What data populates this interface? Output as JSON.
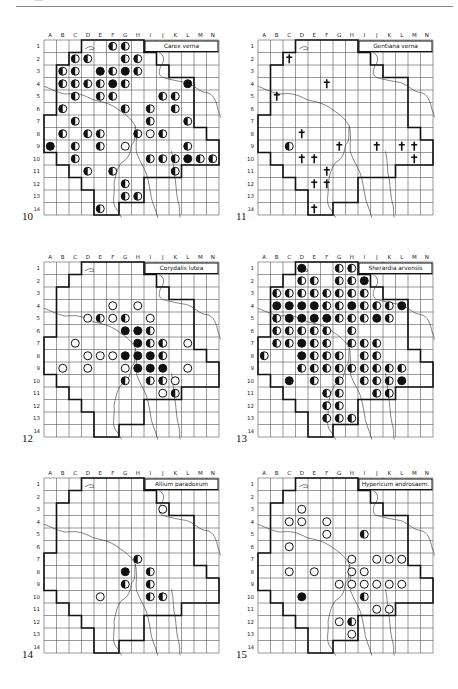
{
  "page": {
    "page_number": "118"
  },
  "grid": {
    "columns": [
      "A",
      "B",
      "C",
      "D",
      "E",
      "F",
      "G",
      "H",
      "I",
      "J",
      "K",
      "L",
      "M",
      "N"
    ],
    "rows": [
      "1",
      "2",
      "3",
      "4",
      "5",
      "6",
      "7",
      "8",
      "9",
      "10",
      "11",
      "12",
      "13",
      "14"
    ]
  },
  "legend_symbols": {
    "open": "open circle",
    "half": "half-filled circle",
    "full": "filled circle",
    "cross": "dagger (extinct)"
  },
  "maps": [
    {
      "figure": "10",
      "species": "Carex verna",
      "records": [
        [
          "F1",
          "half"
        ],
        [
          "G1",
          "half"
        ],
        [
          "C2",
          "half"
        ],
        [
          "D2",
          "half"
        ],
        [
          "G2",
          "half"
        ],
        [
          "H2",
          "half"
        ],
        [
          "B3",
          "half"
        ],
        [
          "C3",
          "half"
        ],
        [
          "E3",
          "full"
        ],
        [
          "F3",
          "half"
        ],
        [
          "G3",
          "full"
        ],
        [
          "H3",
          "half"
        ],
        [
          "B4",
          "half"
        ],
        [
          "C4",
          "half"
        ],
        [
          "D4",
          "half"
        ],
        [
          "E4",
          "half"
        ],
        [
          "F4",
          "full"
        ],
        [
          "G4",
          "half"
        ],
        [
          "L4",
          "full"
        ],
        [
          "C5",
          "half"
        ],
        [
          "E5",
          "half"
        ],
        [
          "F5",
          "half"
        ],
        [
          "J5",
          "half"
        ],
        [
          "K5",
          "half"
        ],
        [
          "B6",
          "half"
        ],
        [
          "G6",
          "half"
        ],
        [
          "I6",
          "half"
        ],
        [
          "K6",
          "half"
        ],
        [
          "C7",
          "half"
        ],
        [
          "I7",
          "half"
        ],
        [
          "L7",
          "half"
        ],
        [
          "B8",
          "half"
        ],
        [
          "D8",
          "half"
        ],
        [
          "E8",
          "half"
        ],
        [
          "H8",
          "half"
        ],
        [
          "I8",
          "open"
        ],
        [
          "J8",
          "half"
        ],
        [
          "A9",
          "full"
        ],
        [
          "C9",
          "half"
        ],
        [
          "E9",
          "half"
        ],
        [
          "G9",
          "open"
        ],
        [
          "L9",
          "half"
        ],
        [
          "C10",
          "half"
        ],
        [
          "I10",
          "half"
        ],
        [
          "J10",
          "half"
        ],
        [
          "K10",
          "half"
        ],
        [
          "L10",
          "full"
        ],
        [
          "M10",
          "half"
        ],
        [
          "N10",
          "half"
        ],
        [
          "D11",
          "half"
        ],
        [
          "F11",
          "half"
        ],
        [
          "K11",
          "half"
        ],
        [
          "G12",
          "half"
        ],
        [
          "G13",
          "half"
        ],
        [
          "H13",
          "half"
        ],
        [
          "E14",
          "half"
        ]
      ]
    },
    {
      "figure": "11",
      "species": "Gentiana verna",
      "records": [
        [
          "C2",
          "cross"
        ],
        [
          "F4",
          "cross"
        ],
        [
          "B5",
          "cross"
        ],
        [
          "D8",
          "cross"
        ],
        [
          "C9",
          "half"
        ],
        [
          "G9",
          "cross"
        ],
        [
          "J9",
          "cross"
        ],
        [
          "L9",
          "cross"
        ],
        [
          "M9",
          "cross"
        ],
        [
          "D10",
          "cross"
        ],
        [
          "E10",
          "cross"
        ],
        [
          "M10",
          "cross"
        ],
        [
          "F11",
          "cross"
        ],
        [
          "E12",
          "cross"
        ],
        [
          "F12",
          "cross"
        ],
        [
          "E14",
          "cross"
        ]
      ]
    },
    {
      "figure": "12",
      "species": "Corydalis lutea",
      "records": [
        [
          "F4",
          "open"
        ],
        [
          "H4",
          "open"
        ],
        [
          "D5",
          "open"
        ],
        [
          "E5",
          "half"
        ],
        [
          "F5",
          "open"
        ],
        [
          "G5",
          "half"
        ],
        [
          "I5",
          "open"
        ],
        [
          "G6",
          "full"
        ],
        [
          "H6",
          "full"
        ],
        [
          "I6",
          "half"
        ],
        [
          "C7",
          "open"
        ],
        [
          "H7",
          "full"
        ],
        [
          "I7",
          "half"
        ],
        [
          "J7",
          "half"
        ],
        [
          "L7",
          "open"
        ],
        [
          "D8",
          "open"
        ],
        [
          "E8",
          "open"
        ],
        [
          "F8",
          "open"
        ],
        [
          "G8",
          "full"
        ],
        [
          "H8",
          "full"
        ],
        [
          "I8",
          "full"
        ],
        [
          "J8",
          "half"
        ],
        [
          "B9",
          "open"
        ],
        [
          "D9",
          "open"
        ],
        [
          "G9",
          "open"
        ],
        [
          "H9",
          "full"
        ],
        [
          "I9",
          "full"
        ],
        [
          "J9",
          "full"
        ],
        [
          "L9",
          "open"
        ],
        [
          "G10",
          "half"
        ],
        [
          "I10",
          "half"
        ],
        [
          "J10",
          "half"
        ],
        [
          "K10",
          "open"
        ],
        [
          "J11",
          "open"
        ],
        [
          "K11",
          "half"
        ]
      ]
    },
    {
      "figure": "13",
      "species": "Sherardia arvensis",
      "records": [
        [
          "D1",
          "full"
        ],
        [
          "G1",
          "half"
        ],
        [
          "H1",
          "half"
        ],
        [
          "D2",
          "half"
        ],
        [
          "E2",
          "half"
        ],
        [
          "G2",
          "half"
        ],
        [
          "H2",
          "half"
        ],
        [
          "I2",
          "full"
        ],
        [
          "B3",
          "half"
        ],
        [
          "C3",
          "half"
        ],
        [
          "D3",
          "half"
        ],
        [
          "E3",
          "half"
        ],
        [
          "F3",
          "half"
        ],
        [
          "G3",
          "half"
        ],
        [
          "H3",
          "half"
        ],
        [
          "I3",
          "half"
        ],
        [
          "B4",
          "full"
        ],
        [
          "C4",
          "full"
        ],
        [
          "D4",
          "full"
        ],
        [
          "E4",
          "full"
        ],
        [
          "F4",
          "half"
        ],
        [
          "G4",
          "half"
        ],
        [
          "H4",
          "full"
        ],
        [
          "I4",
          "half"
        ],
        [
          "J4",
          "half"
        ],
        [
          "K4",
          "half"
        ],
        [
          "L4",
          "full"
        ],
        [
          "B5",
          "half"
        ],
        [
          "C5",
          "full"
        ],
        [
          "D5",
          "full"
        ],
        [
          "E5",
          "full"
        ],
        [
          "F5",
          "full"
        ],
        [
          "G5",
          "half"
        ],
        [
          "H5",
          "half"
        ],
        [
          "I5",
          "half"
        ],
        [
          "J5",
          "full"
        ],
        [
          "K5",
          "half"
        ],
        [
          "B6",
          "half"
        ],
        [
          "C6",
          "half"
        ],
        [
          "D6",
          "half"
        ],
        [
          "E6",
          "half"
        ],
        [
          "F6",
          "half"
        ],
        [
          "H6",
          "half"
        ],
        [
          "B7",
          "half"
        ],
        [
          "C7",
          "half"
        ],
        [
          "D7",
          "full"
        ],
        [
          "E7",
          "half"
        ],
        [
          "F7",
          "half"
        ],
        [
          "H7",
          "half"
        ],
        [
          "I7",
          "half"
        ],
        [
          "J7",
          "half"
        ],
        [
          "A8",
          "half"
        ],
        [
          "D8",
          "full"
        ],
        [
          "E8",
          "half"
        ],
        [
          "F8",
          "half"
        ],
        [
          "G8",
          "half"
        ],
        [
          "I8",
          "half"
        ],
        [
          "J8",
          "half"
        ],
        [
          "D9",
          "half"
        ],
        [
          "E9",
          "half"
        ],
        [
          "F9",
          "half"
        ],
        [
          "G9",
          "half"
        ],
        [
          "H9",
          "half"
        ],
        [
          "I9",
          "half"
        ],
        [
          "J9",
          "half"
        ],
        [
          "K9",
          "half"
        ],
        [
          "L9",
          "half"
        ],
        [
          "C10",
          "full"
        ],
        [
          "E10",
          "half"
        ],
        [
          "G10",
          "half"
        ],
        [
          "I10",
          "half"
        ],
        [
          "J10",
          "half"
        ],
        [
          "K10",
          "half"
        ],
        [
          "L10",
          "full"
        ],
        [
          "F11",
          "half"
        ],
        [
          "G11",
          "half"
        ],
        [
          "J11",
          "half"
        ],
        [
          "K11",
          "half"
        ],
        [
          "F12",
          "half"
        ],
        [
          "G12",
          "half"
        ],
        [
          "F13",
          "half"
        ],
        [
          "G13",
          "half"
        ],
        [
          "H13",
          "half"
        ]
      ]
    },
    {
      "figure": "14",
      "species": "Allium paradoxum",
      "records": [
        [
          "J3",
          "open"
        ],
        [
          "H7",
          "half"
        ],
        [
          "G8",
          "full"
        ],
        [
          "I8",
          "half"
        ],
        [
          "G9",
          "half"
        ],
        [
          "I9",
          "half"
        ],
        [
          "E10",
          "open"
        ],
        [
          "I10",
          "half"
        ],
        [
          "J10",
          "half"
        ]
      ]
    },
    {
      "figure": "15",
      "species": "Hypericum androsaem.",
      "records": [
        [
          "D3",
          "open"
        ],
        [
          "C4",
          "open"
        ],
        [
          "D4",
          "open"
        ],
        [
          "F4",
          "open"
        ],
        [
          "F5",
          "open"
        ],
        [
          "I5",
          "half"
        ],
        [
          "C6",
          "open"
        ],
        [
          "H7",
          "open"
        ],
        [
          "J7",
          "open"
        ],
        [
          "K7",
          "open"
        ],
        [
          "L7",
          "open"
        ],
        [
          "C8",
          "open"
        ],
        [
          "E8",
          "open"
        ],
        [
          "H8",
          "open"
        ],
        [
          "I8",
          "open"
        ],
        [
          "G9",
          "open"
        ],
        [
          "H9",
          "open"
        ],
        [
          "I9",
          "open"
        ],
        [
          "J9",
          "open"
        ],
        [
          "K9",
          "open"
        ],
        [
          "L9",
          "open"
        ],
        [
          "D10",
          "full"
        ],
        [
          "I10",
          "half"
        ],
        [
          "J11",
          "open"
        ],
        [
          "K11",
          "open"
        ],
        [
          "G12",
          "open"
        ],
        [
          "H12",
          "half"
        ],
        [
          "H13",
          "open"
        ]
      ]
    }
  ]
}
